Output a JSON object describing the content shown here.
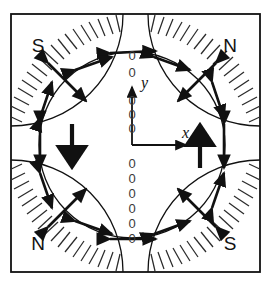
{
  "figure": {
    "background_color": "#ffffff",
    "line_color": "#111111",
    "hatch_color": "#2b2b2b",
    "zero_color": "#3a3a3a",
    "frame": {
      "x": 11,
      "y": 14,
      "width": 249,
      "height": 258,
      "stroke_width": 1.6
    },
    "circle": {
      "cx": 132,
      "cy": 145,
      "r": 93,
      "stroke_width": 1.2
    }
  },
  "pole_labels": [
    {
      "text": "S",
      "x": 38,
      "y": 52,
      "corner": "top-left"
    },
    {
      "text": "N",
      "x": 228,
      "y": 52,
      "corner": "top-right"
    },
    {
      "text": "N",
      "x": 38,
      "y": 247,
      "corner": "bottom-left"
    },
    {
      "text": "S",
      "x": 228,
      "y": 247,
      "corner": "bottom-right"
    }
  ],
  "axes": {
    "origin": {
      "x": 132,
      "y": 145
    },
    "x_axis": {
      "label": "x",
      "label_x": 182,
      "label_y": 137,
      "length": 54,
      "direction": "right"
    },
    "y_axis": {
      "label": "y",
      "label_x": 141,
      "label_y": 83,
      "length": 58,
      "direction": "up"
    }
  },
  "zero_column": {
    "glyph": "0",
    "description": "column of out-of-page field markers along vertical centerline",
    "x": 132,
    "above_origin_plain": [
      55,
      72
    ],
    "above_origin_on_axis": [
      100,
      114,
      128
    ],
    "below_origin_plain": [
      163,
      178,
      193,
      208,
      223,
      238
    ]
  },
  "bulk_arrows": [
    {
      "name": "left-down-arrow",
      "x": 72,
      "y1": 124,
      "y2": 170,
      "direction": "down"
    },
    {
      "name": "right-up-arrow",
      "x": 200,
      "y1": 170,
      "y2": 124,
      "direction": "up"
    }
  ],
  "circle_arrows": [
    {
      "angle_deg": 90,
      "type": "tangential-double",
      "note": "top, horizontal double-headed"
    },
    {
      "angle_deg": 270,
      "type": "tangential-double",
      "note": "bottom, horizontal double-headed"
    },
    {
      "angle_deg": 180,
      "type": "vertical-double",
      "note": "left, vertical double-headed"
    },
    {
      "angle_deg": 0,
      "type": "vertical-double",
      "note": "right, vertical double-headed"
    },
    {
      "angle_deg": 115,
      "type": "tilted-double"
    },
    {
      "angle_deg": 65,
      "type": "tilted-double"
    },
    {
      "angle_deg": 135,
      "type": "radial-double",
      "note": "crosses hatched arc"
    },
    {
      "angle_deg": 45,
      "type": "radial-double",
      "note": "crosses hatched arc"
    },
    {
      "angle_deg": 225,
      "type": "radial-double",
      "note": "crosses hatched arc"
    },
    {
      "angle_deg": 315,
      "type": "radial-double",
      "note": "crosses hatched arc"
    },
    {
      "angle_deg": 155,
      "type": "tilted-double"
    },
    {
      "angle_deg": 205,
      "type": "tilted-double"
    },
    {
      "angle_deg": 25,
      "type": "tilted-double"
    },
    {
      "angle_deg": 335,
      "type": "tilted-double"
    },
    {
      "angle_deg": 245,
      "type": "tilted-double"
    },
    {
      "angle_deg": 295,
      "type": "tilted-double"
    }
  ],
  "corner_arcs": [
    {
      "corner": "top-left",
      "cx": 11,
      "cy": 14,
      "r": 112,
      "hatch_side": "inner"
    },
    {
      "corner": "top-right",
      "cx": 260,
      "cy": 14,
      "r": 112,
      "hatch_side": "inner"
    },
    {
      "corner": "bottom-left",
      "cx": 11,
      "cy": 272,
      "r": 112,
      "hatch_side": "inner"
    },
    {
      "corner": "bottom-right",
      "cx": 260,
      "cy": 272,
      "r": 112,
      "hatch_side": "inner"
    }
  ]
}
